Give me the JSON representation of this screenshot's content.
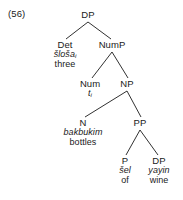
{
  "figure": {
    "example_number": "(56)",
    "type": "syntax-tree",
    "language_gloss_style": "transliteration-over-gloss"
  },
  "tree": {
    "root": {
      "category": "DP"
    },
    "nodes": {
      "dp_root": {
        "category": "DP"
      },
      "det": {
        "category": "Det",
        "form": "šloša",
        "index": "i",
        "gloss": "three"
      },
      "nump": {
        "category": "NumP"
      },
      "num": {
        "category": "Num",
        "trace": "t",
        "trace_index": "i"
      },
      "np": {
        "category": "NP"
      },
      "n": {
        "category": "N",
        "form": "bakbukim",
        "gloss": "bottles"
      },
      "pp": {
        "category": "PP"
      },
      "p": {
        "category": "P",
        "form": "šel",
        "gloss": "of"
      },
      "dp_obj": {
        "category": "DP",
        "form": "yayin",
        "gloss": "wine"
      }
    }
  },
  "style": {
    "line_color": "#1a1a1a",
    "text_color": "#1a1a1a",
    "background": "#ffffff"
  }
}
